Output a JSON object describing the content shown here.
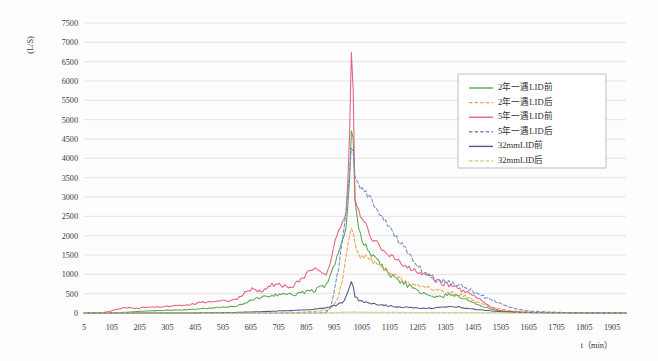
{
  "chart_data": {
    "type": "line",
    "title": "",
    "xlabel": "t（min）",
    "ylabel": "(L/S)",
    "xlim": [
      5,
      1955
    ],
    "ylim": [
      0,
      7500
    ],
    "ystep": 500,
    "grid": true,
    "legend_position": "top-right",
    "y_ticks": [
      "0",
      "500",
      "1000",
      "1500",
      "2000",
      "2500",
      "3000",
      "3500",
      "4000",
      "4500",
      "5000",
      "5500",
      "6000",
      "6500",
      "7000",
      "7500"
    ],
    "x_ticks": [
      "5",
      "105",
      "205",
      "305",
      "405",
      "505",
      "605",
      "705",
      "805",
      "905",
      "1005",
      "1105",
      "1205",
      "1305",
      "1405",
      "1505",
      "1605",
      "1705",
      "1805",
      "1905"
    ],
    "x": [
      5,
      35,
      65,
      95,
      125,
      155,
      185,
      215,
      245,
      275,
      305,
      335,
      365,
      395,
      425,
      455,
      485,
      515,
      545,
      575,
      605,
      635,
      665,
      695,
      725,
      755,
      785,
      815,
      845,
      875,
      890,
      905,
      920,
      935,
      950,
      960,
      965,
      970,
      975,
      980,
      995,
      1010,
      1025,
      1040,
      1055,
      1085,
      1115,
      1145,
      1175,
      1205,
      1235,
      1265,
      1295,
      1325,
      1355,
      1385,
      1415,
      1445,
      1475,
      1505,
      1535,
      1565,
      1595,
      1655,
      1715,
      1775,
      1835,
      1905,
      1955
    ],
    "series": [
      {
        "name": "2年一遇LID前",
        "color": "#5AA84F",
        "dash": "none",
        "peak": 5100,
        "values": [
          0,
          0,
          0,
          0,
          10,
          20,
          30,
          45,
          55,
          60,
          70,
          75,
          80,
          95,
          110,
          125,
          140,
          150,
          165,
          230,
          330,
          390,
          430,
          470,
          500,
          470,
          520,
          560,
          620,
          700,
          900,
          1250,
          1600,
          1820,
          2300,
          3400,
          4400,
          5100,
          4200,
          2900,
          2100,
          1800,
          1700,
          1500,
          1400,
          1150,
          950,
          820,
          700,
          560,
          470,
          400,
          430,
          490,
          420,
          330,
          230,
          160,
          90,
          55,
          35,
          22,
          15,
          9,
          6,
          4,
          3,
          2,
          1
        ]
      },
      {
        "name": "2年一遇LID后",
        "color": "#EFA34C",
        "dash": "dashed",
        "peak": 2200,
        "values": [
          0,
          0,
          0,
          0,
          0,
          0,
          0,
          0,
          0,
          0,
          0,
          0,
          0,
          0,
          0,
          0,
          0,
          0,
          0,
          0,
          0,
          0,
          0,
          0,
          5,
          10,
          18,
          30,
          45,
          70,
          110,
          200,
          420,
          900,
          1600,
          1950,
          2100,
          2200,
          2080,
          1800,
          1500,
          1450,
          1420,
          1350,
          1300,
          1150,
          1000,
          880,
          790,
          700,
          640,
          600,
          560,
          520,
          480,
          400,
          300,
          210,
          140,
          95,
          60,
          40,
          28,
          16,
          10,
          6,
          4,
          2,
          1
        ]
      },
      {
        "name": "5年一遇LID前",
        "color": "#E8617E",
        "dash": "none",
        "peak": 7250,
        "values": [
          0,
          0,
          0,
          40,
          100,
          140,
          120,
          140,
          160,
          150,
          170,
          185,
          200,
          230,
          270,
          290,
          300,
          310,
          330,
          470,
          620,
          560,
          680,
          750,
          680,
          720,
          850,
          1100,
          1200,
          1000,
          1300,
          1750,
          2100,
          2400,
          2600,
          4500,
          6300,
          7250,
          5200,
          3000,
          2600,
          2400,
          2200,
          1950,
          1850,
          1600,
          1450,
          1300,
          1150,
          1050,
          1000,
          900,
          780,
          680,
          620,
          520,
          420,
          260,
          120,
          55,
          35,
          25,
          18,
          11,
          7,
          5,
          3,
          2,
          1
        ]
      },
      {
        "name": "5年一遇LID后",
        "color": "#6E8CCB",
        "dash": "dashed",
        "peak": 4420,
        "values": [
          0,
          0,
          0,
          0,
          0,
          0,
          0,
          0,
          0,
          0,
          0,
          0,
          0,
          0,
          0,
          0,
          0,
          0,
          0,
          0,
          0,
          0,
          0,
          0,
          0,
          0,
          0,
          0,
          0,
          10,
          120,
          500,
          1100,
          1900,
          2800,
          3600,
          4050,
          4420,
          4100,
          3500,
          3300,
          3200,
          3050,
          2900,
          2750,
          2400,
          2100,
          1800,
          1550,
          1250,
          1000,
          870,
          830,
          780,
          700,
          620,
          520,
          420,
          330,
          240,
          160,
          100,
          62,
          30,
          16,
          9,
          5,
          3,
          1
        ]
      },
      {
        "name": "32mmLID前",
        "color": "#57588C",
        "dash": "none",
        "peak": 790,
        "values": [
          0,
          0,
          0,
          0,
          0,
          0,
          0,
          0,
          0,
          0,
          0,
          0,
          0,
          2,
          4,
          6,
          8,
          10,
          14,
          20,
          28,
          34,
          40,
          48,
          58,
          66,
          76,
          90,
          110,
          135,
          160,
          190,
          230,
          280,
          430,
          620,
          740,
          790,
          650,
          420,
          320,
          290,
          270,
          250,
          230,
          200,
          175,
          155,
          140,
          130,
          125,
          130,
          150,
          175,
          150,
          120,
          95,
          70,
          50,
          36,
          25,
          17,
          12,
          7,
          5,
          3,
          2,
          1,
          1
        ]
      },
      {
        "name": "32mmLID后",
        "color": "#C9D775",
        "dash": "dashed",
        "peak": 30,
        "values": [
          0,
          0,
          0,
          0,
          0,
          0,
          0,
          0,
          0,
          0,
          0,
          0,
          0,
          0,
          0,
          0,
          0,
          0,
          0,
          0,
          0,
          0,
          0,
          0,
          0,
          0,
          0,
          0,
          0,
          2,
          4,
          8,
          14,
          20,
          26,
          28,
          29,
          30,
          29,
          27,
          25,
          24,
          23,
          22,
          21,
          19,
          18,
          16,
          15,
          14,
          13,
          12,
          11,
          10,
          9,
          8,
          7,
          6,
          5,
          4,
          3,
          2,
          2,
          1,
          1,
          1,
          0,
          0,
          0
        ]
      }
    ]
  },
  "legend": {
    "entries": [
      {
        "label": "2年一遇LID前"
      },
      {
        "label": "2年一遇LID后"
      },
      {
        "label": "5年一遇LID前"
      },
      {
        "label": "5年一遇LID后"
      },
      {
        "label": "32mmLID前"
      },
      {
        "label": "32mmLID后"
      }
    ]
  },
  "axes": {
    "y_title": "(L/S)",
    "x_title": "t（min）"
  }
}
